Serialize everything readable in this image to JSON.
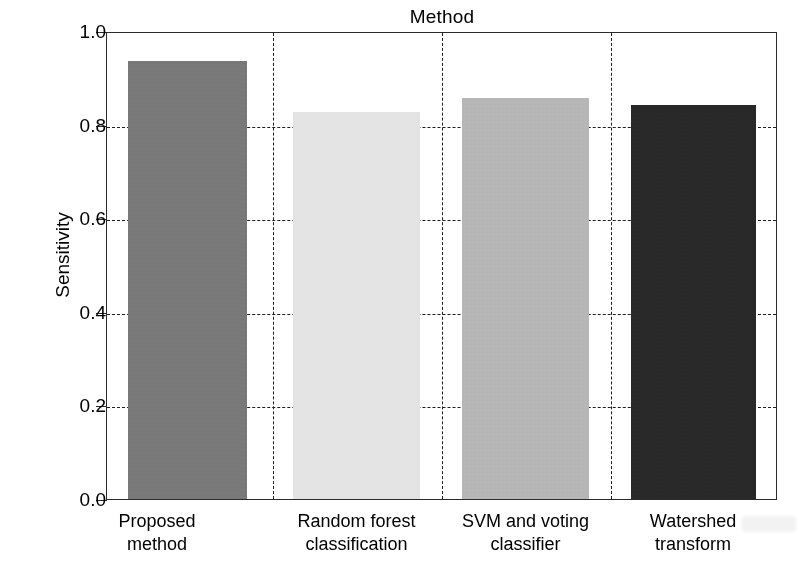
{
  "chart_data": {
    "type": "bar",
    "title": "Method",
    "xlabel": "Method",
    "ylabel": "Sensitivity",
    "categories": [
      "Proposed method",
      "Random forest classification",
      "SVM and voting classifier",
      "Watershed transform"
    ],
    "category_lines": [
      [
        "Proposed",
        "method"
      ],
      [
        "Random forest",
        "classification"
      ],
      [
        "SVM and voting",
        "classifier"
      ],
      [
        "Watershed",
        "transform"
      ]
    ],
    "values": [
      0.94,
      0.83,
      0.86,
      0.845
    ],
    "ylim": [
      0.0,
      1.0
    ],
    "yticks": [
      "0.0",
      "0.2",
      "0.4",
      "0.6",
      "0.8",
      "1.0"
    ],
    "ytick_values": [
      0.0,
      0.2,
      0.4,
      0.6,
      0.8,
      1.0
    ],
    "grid": "horizontal dashed gridlines at each y tick; vertical dashed separators between categories",
    "legend": "none",
    "bar_colors": [
      "#767676",
      "#e3e3e3",
      "#b5b5b5",
      "#272727"
    ]
  },
  "figure": {
    "background_color": "#ffffff",
    "axis_color": "#2b2b2b",
    "grid_color": "#1d1d1d"
  }
}
